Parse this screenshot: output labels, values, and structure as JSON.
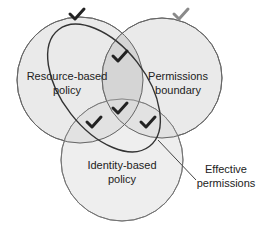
{
  "diagram": {
    "type": "venn",
    "sets": [
      {
        "id": "resource",
        "line1": "Resource-based",
        "line2": "policy"
      },
      {
        "id": "boundary",
        "line1": "Permissions",
        "line2": "boundary"
      },
      {
        "id": "identity",
        "line1": "Identity-based",
        "line2": "policy"
      }
    ],
    "callout": {
      "line1": "Effective",
      "line2": "permissions"
    },
    "checkmarks": [
      {
        "region": "resource-only",
        "style": "dark"
      },
      {
        "region": "boundary-only",
        "style": "light"
      },
      {
        "region": "resource-boundary",
        "style": "dark"
      },
      {
        "region": "resource-identity",
        "style": "dark"
      },
      {
        "region": "all-three",
        "style": "dark"
      },
      {
        "region": "boundary-identity",
        "style": "dark"
      }
    ],
    "colors": {
      "circle_fill": "#e6e6e6",
      "overlap_fill": "#d2d2d2",
      "stroke": "#555555",
      "check_dark": "#222222",
      "check_light": "#8a8a8a"
    }
  }
}
